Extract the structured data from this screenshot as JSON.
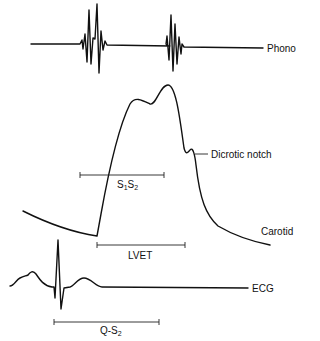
{
  "figure": {
    "type": "cardiac timing diagram",
    "traces": [
      {
        "name": "phono",
        "label": "Phono"
      },
      {
        "name": "carotid",
        "label": "Carotid"
      },
      {
        "name": "ecg",
        "label": "ECG"
      }
    ],
    "annotations": {
      "dicrotic_notch": "Dicrotic notch",
      "s1s2": {
        "main": "S",
        "sub1": "1",
        "mid": "S",
        "sub2": "2"
      },
      "lvet": "LVET",
      "qs2": {
        "main": "Q-S",
        "sub": "2"
      }
    },
    "colors": {
      "line": "#111111",
      "background": "#ffffff"
    }
  }
}
